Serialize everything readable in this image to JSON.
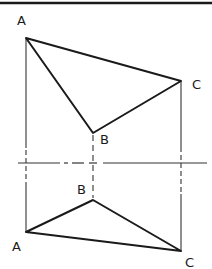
{
  "diagram": {
    "type": "orthographic-projection",
    "colors": {
      "line": "#1a1a1a",
      "construction": "#333333",
      "background": "#ffffff"
    },
    "top_view": {
      "points": {
        "A": {
          "label": "A",
          "x": 26,
          "y": 38
        },
        "B": {
          "label": "B",
          "x": 93,
          "y": 133
        },
        "C": {
          "label": "C",
          "x": 181,
          "y": 81
        }
      },
      "labels": {
        "A": "A",
        "B": "B",
        "C": "C"
      }
    },
    "front_view": {
      "points": {
        "A": {
          "label": "A",
          "x": 26,
          "y": 232
        },
        "B": {
          "label": "B",
          "x": 93,
          "y": 200
        },
        "C": {
          "label": "C",
          "x": 181,
          "y": 251
        }
      },
      "labels": {
        "A": "A",
        "B": "B",
        "C": "C"
      }
    },
    "folding_line": {
      "y": 163,
      "style": "dash-dot"
    }
  }
}
